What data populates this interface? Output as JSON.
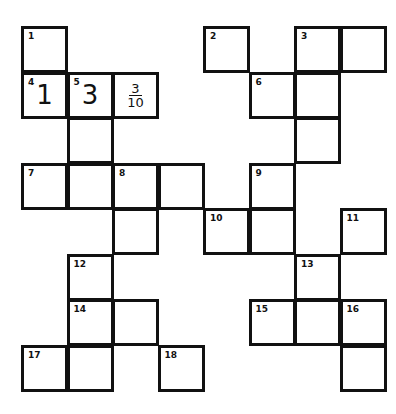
{
  "puzzle": {
    "type": "crossword",
    "grid_origin": {
      "x": 22,
      "y": 27
    },
    "cell_size": 45.5,
    "cells": [
      {
        "col": 0,
        "row": 0,
        "number": "1"
      },
      {
        "col": 4,
        "row": 0,
        "number": "2"
      },
      {
        "col": 6,
        "row": 0,
        "number": "3"
      },
      {
        "col": 7,
        "row": 0
      },
      {
        "col": 0,
        "row": 1,
        "number": "4",
        "value": "1"
      },
      {
        "col": 1,
        "row": 1,
        "number": "5",
        "value": "3"
      },
      {
        "col": 2,
        "row": 1,
        "fraction": {
          "numerator": "3",
          "denominator": "10"
        }
      },
      {
        "col": 5,
        "row": 1,
        "number": "6"
      },
      {
        "col": 6,
        "row": 1
      },
      {
        "col": 1,
        "row": 2
      },
      {
        "col": 6,
        "row": 2
      },
      {
        "col": 0,
        "row": 3,
        "number": "7"
      },
      {
        "col": 1,
        "row": 3
      },
      {
        "col": 2,
        "row": 3,
        "number": "8"
      },
      {
        "col": 3,
        "row": 3
      },
      {
        "col": 5,
        "row": 3,
        "number": "9"
      },
      {
        "col": 2,
        "row": 4
      },
      {
        "col": 4,
        "row": 4,
        "number": "10"
      },
      {
        "col": 5,
        "row": 4
      },
      {
        "col": 7,
        "row": 4,
        "number": "11"
      },
      {
        "col": 1,
        "row": 5,
        "number": "12"
      },
      {
        "col": 6,
        "row": 5,
        "number": "13"
      },
      {
        "col": 1,
        "row": 6,
        "number": "14"
      },
      {
        "col": 2,
        "row": 6
      },
      {
        "col": 5,
        "row": 6,
        "number": "15"
      },
      {
        "col": 6,
        "row": 6
      },
      {
        "col": 7,
        "row": 6,
        "number": "16"
      },
      {
        "col": 0,
        "row": 7,
        "number": "17"
      },
      {
        "col": 1,
        "row": 7
      },
      {
        "col": 3,
        "row": 7,
        "number": "18"
      },
      {
        "col": 7,
        "row": 7
      }
    ]
  },
  "colors": {
    "border": "#111111",
    "background": "#ffffff"
  }
}
